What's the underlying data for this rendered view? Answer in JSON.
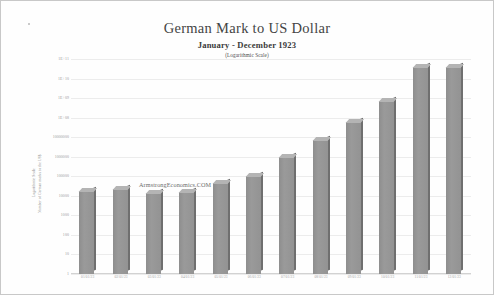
{
  "page": {
    "background": "#fefefe",
    "border_color": "#c8c8c8"
  },
  "titles": {
    "main": "German Mark to US Dollar",
    "subtitle": "January - December 1923",
    "note": "(Logarithmic Scale)"
  },
  "watermark": "ArmstrongEconomics.COM",
  "axes": {
    "y_title_1": "Logarithmic Scale",
    "y_title_2": "Number of German marks to the US$"
  },
  "chart_data": {
    "type": "bar",
    "title": "German Mark to US Dollar",
    "subtitle": "January - December 1923",
    "annotation": "(Logarithmic Scale)",
    "xlabel": "",
    "ylabel": "Number of German marks to the US$",
    "yscale": "log",
    "ylim": [
      1,
      100000000000
    ],
    "grid": true,
    "legend": false,
    "bar_color": "#939393",
    "bar_top_color": "#b4b4b4",
    "bar_side_color": "#6f6f6f",
    "categories": [
      "01/01/23",
      "02/01/23",
      "03/01/23",
      "04/01/23",
      "05/01/23",
      "06/01/23",
      "07/01/23",
      "08/01/23",
      "09/01/23",
      "10/01/23",
      "11/01/23",
      "12/01/23"
    ],
    "values": [
      17972,
      27918,
      21190,
      24457,
      47670,
      109966,
      1104000,
      1100000000,
      23540000000,
      6015000000000,
      42000000000000,
      42000000000000
    ],
    "display_values": [
      "17,972",
      "27,918",
      "21,190",
      "24,457",
      "47,670",
      "109,966",
      "1,104,000",
      "1,100,000,000",
      "23,540,000,000",
      "6,015,000,000,000",
      "42,000,000,000,000",
      "42,000,000,000,000"
    ],
    "yticks": [
      "1E+11",
      "1E+10",
      "1E+09",
      "1E+08",
      "10000000",
      "1000000",
      "100000",
      "10000",
      "1000",
      "100",
      "10",
      "1"
    ],
    "ytick_values": [
      100000000000,
      10000000000,
      1000000000,
      100000000,
      10000000,
      1000000,
      100000,
      10000,
      1000,
      100,
      10,
      1
    ],
    "bar_fractions": [
      0.385,
      0.395,
      0.375,
      0.38,
      0.425,
      0.455,
      0.545,
      0.625,
      0.705,
      0.805,
      0.965,
      0.965
    ]
  }
}
